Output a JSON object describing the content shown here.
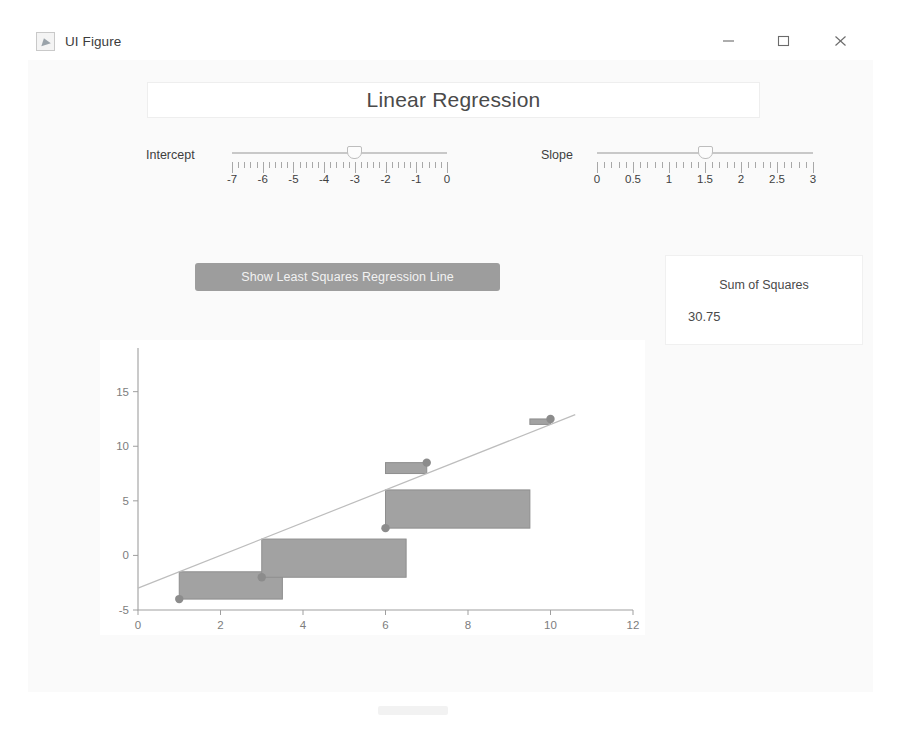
{
  "window": {
    "title": "UI Figure",
    "icon": "matlab-figure-icon",
    "controls": {
      "minimize": "minimize-icon",
      "maximize": "maximize-icon",
      "close": "close-icon"
    }
  },
  "header": {
    "title": "Linear Regression"
  },
  "controls": {
    "intercept": {
      "label": "Intercept",
      "min": -7,
      "max": 0,
      "value": -3,
      "step": 0.25,
      "tick_labels": [
        "-7",
        "-6",
        "-5",
        "-4",
        "-3",
        "-2",
        "-1",
        "0"
      ],
      "tick_values": [
        -7,
        -6,
        -5,
        -4,
        -3,
        -2,
        -1,
        0
      ]
    },
    "slope": {
      "label": "Slope",
      "min": 0,
      "max": 3,
      "value": 1.5,
      "step": 0.1,
      "tick_labels": [
        "0",
        "0.5",
        "1",
        "1.5",
        "2",
        "2.5",
        "3"
      ],
      "tick_values": [
        0,
        0.5,
        1,
        1.5,
        2,
        2.5,
        3
      ]
    },
    "least_squares_button": "Show Least Squares Regression Line"
  },
  "sum_of_squares": {
    "label": "Sum of Squares",
    "value": "30.75"
  },
  "chart_data": {
    "type": "scatter",
    "title": "",
    "xlabel": "",
    "ylabel": "",
    "xlim": [
      0,
      12
    ],
    "ylim": [
      -5,
      19
    ],
    "xticks": [
      0,
      2,
      4,
      6,
      8,
      10,
      12
    ],
    "xtick_labels": [
      "0",
      "2",
      "4",
      "6",
      "8",
      "10",
      "12"
    ],
    "yticks": [
      -5,
      0,
      5,
      10,
      15
    ],
    "ytick_labels": [
      "-5",
      "0",
      "5",
      "10",
      "15"
    ],
    "grid": false,
    "legend": null,
    "points": [
      {
        "x": 1,
        "y": -4
      },
      {
        "x": 3,
        "y": -2
      },
      {
        "x": 6,
        "y": 2.5
      },
      {
        "x": 7,
        "y": 8.5
      },
      {
        "x": 10,
        "y": 12.5
      }
    ],
    "line": {
      "name": "regression-line",
      "intercept": -3,
      "slope": 1.5,
      "x_start": 0,
      "x_end": 10.6,
      "color": "#bdbdbd"
    },
    "residual_squares": [
      {
        "x": 1,
        "y": -4,
        "fitted": -1.5,
        "side": 2.5
      },
      {
        "x": 3,
        "y": -2,
        "fitted": 1.5,
        "side": 3.5
      },
      {
        "x": 6,
        "y": 2.5,
        "fitted": 6.0,
        "side": 3.5
      },
      {
        "x": 7,
        "y": 8.5,
        "fitted": 7.5,
        "side": 1.0
      },
      {
        "x": 10,
        "y": 12.5,
        "fitted": 12.0,
        "side": 0.5
      }
    ],
    "square_color": "#a2a2a2",
    "point_color": "#8c8c8c"
  }
}
